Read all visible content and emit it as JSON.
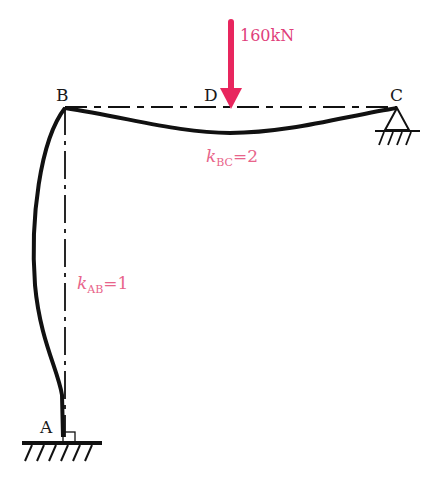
{
  "diagram": {
    "type": "structural frame with deflected shape",
    "nodes": {
      "A": {
        "label": "A",
        "support": "fixed"
      },
      "B": {
        "label": "B",
        "support": "rigid joint"
      },
      "C": {
        "label": "C",
        "support": "pinned"
      },
      "D": {
        "label": "D",
        "note": "load point on beam BC"
      }
    },
    "load": {
      "label": "160kN",
      "at": "D",
      "direction": "downward",
      "color": "#e8265e"
    },
    "members": [
      {
        "id": "AB",
        "stiffness_symbol": "k",
        "subscript": "AB",
        "eq": "=1"
      },
      {
        "id": "BC",
        "stiffness_symbol": "k",
        "subscript": "BC",
        "eq": "=2"
      }
    ],
    "label_color": "#e8648a"
  }
}
